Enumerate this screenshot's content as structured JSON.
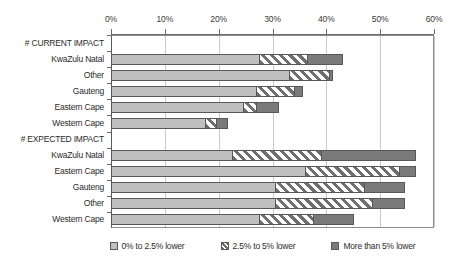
{
  "chart_data": {
    "type": "bar",
    "orientation": "horizontal",
    "stacked": true,
    "title": "",
    "xlabel": "",
    "ylabel": "",
    "xlim": [
      0,
      60
    ],
    "xtick_labels": [
      "0%",
      "10%",
      "20%",
      "30%",
      "40%",
      "50%",
      "60%"
    ],
    "xtick_values": [
      0,
      10,
      20,
      30,
      40,
      50,
      60
    ],
    "grid": true,
    "legend_position": "bottom",
    "categories": [
      "# CURRENT IMPACT",
      "KwaZulu Natal",
      "Other",
      "Gauteng",
      "Eastern Cape",
      "Western Cape",
      "# EXPECTED IMPACT",
      "KwaZulu Natal",
      "Eastern Cape",
      "Gauteng",
      "Other",
      "Western Cape"
    ],
    "series": [
      {
        "name": "0% to 2.5% lower",
        "values": [
          null,
          27.5,
          33.0,
          27.0,
          24.5,
          17.5,
          null,
          22.5,
          36.0,
          30.5,
          30.5,
          27.5
        ]
      },
      {
        "name": "2.5% to 5% lower",
        "values": [
          null,
          9.0,
          7.5,
          7.0,
          2.5,
          2.0,
          null,
          16.5,
          17.5,
          16.5,
          18.0,
          10.0
        ]
      },
      {
        "name": "More than 5% lower",
        "values": [
          null,
          6.5,
          0.5,
          1.5,
          4.0,
          2.0,
          null,
          17.5,
          3.0,
          7.5,
          6.0,
          7.5
        ]
      }
    ],
    "totals": [
      null,
      43.0,
      41.0,
      35.5,
      31.0,
      21.5,
      null,
      56.5,
      56.5,
      54.5,
      54.5,
      45.0
    ],
    "colors": {
      "series_0": "#c0c0c0",
      "series_1": "#6e6e6e",
      "series_2": "#7a7a7a",
      "grid": "#c9c9c9",
      "axis": "#6b6b6b",
      "text": "#2b2b2b"
    }
  },
  "legend": {
    "items": [
      {
        "label": "0% to 2.5% lower",
        "swatch": "legend-swatch-light-grey"
      },
      {
        "label": "2.5% to 5% lower",
        "swatch": "legend-swatch-hatched"
      },
      {
        "label": "More than 5% lower",
        "swatch": "legend-swatch-dark-grey"
      }
    ]
  }
}
